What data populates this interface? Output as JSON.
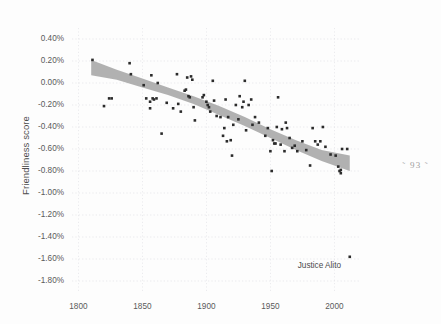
{
  "page": {
    "page_number_label": "˜ 93 ˜",
    "background_color": "#fdfdfd"
  },
  "figure": {
    "y_axis_title": "Friendliness score",
    "x_axis_title": "",
    "annotation_label": "Justice Alito"
  },
  "chart_data": {
    "type": "scatter",
    "title": "",
    "xlabel": "",
    "ylabel": "Friendliness score",
    "xlim": [
      1795,
      2020
    ],
    "ylim": [
      -1.9,
      0.5
    ],
    "grid": true,
    "legend": false,
    "y_tick_labels": [
      "0.40%",
      "0.20%",
      "0.00%",
      "-0.20%",
      "-0.40%",
      "-0.60%",
      "-0.80%",
      "-1.00%",
      "-1.20%",
      "-1.40%",
      "-1.60%",
      "-1.80%"
    ],
    "y_tick_values": [
      0.4,
      0.2,
      0.0,
      -0.2,
      -0.4,
      -0.6,
      -0.8,
      -1.0,
      -1.2,
      -1.4,
      -1.6,
      -1.8
    ],
    "x_tick_labels": [
      "1800",
      "1850",
      "1900",
      "1950",
      "2000"
    ],
    "x_tick_values": [
      1800,
      1850,
      1900,
      1950,
      2000
    ],
    "point_color": "#2b2b2b",
    "band_color": "#a8a8a8",
    "grid_color": "#d8d8e0",
    "annotations": [
      {
        "label": "Justice Alito",
        "x": 2012,
        "y": -1.58
      }
    ],
    "trend_band": {
      "description": "regression fit with confidence interval, declining from about +0.15% in 1810 to about -0.72% in 2012",
      "x": [
        1810,
        1830,
        1850,
        1870,
        1890,
        1910,
        1930,
        1950,
        1970,
        1990,
        2012
      ],
      "upper": [
        0.21,
        0.12,
        0.04,
        -0.04,
        -0.12,
        -0.21,
        -0.31,
        -0.42,
        -0.52,
        -0.61,
        -0.66
      ],
      "lower": [
        0.07,
        0.03,
        -0.04,
        -0.11,
        -0.19,
        -0.29,
        -0.39,
        -0.5,
        -0.61,
        -0.71,
        -0.8
      ]
    },
    "points": [
      {
        "x": 1811,
        "y": 0.21
      },
      {
        "x": 1820,
        "y": -0.21
      },
      {
        "x": 1824,
        "y": -0.14
      },
      {
        "x": 1826,
        "y": -0.14
      },
      {
        "x": 1840,
        "y": 0.18
      },
      {
        "x": 1841,
        "y": 0.08
      },
      {
        "x": 1851,
        "y": -0.02
      },
      {
        "x": 1853,
        "y": -0.14
      },
      {
        "x": 1856,
        "y": -0.17
      },
      {
        "x": 1856,
        "y": -0.23
      },
      {
        "x": 1857,
        "y": 0.07
      },
      {
        "x": 1858,
        "y": -0.14
      },
      {
        "x": 1859,
        "y": -0.15
      },
      {
        "x": 1861,
        "y": -0.14
      },
      {
        "x": 1862,
        "y": 0.0
      },
      {
        "x": 1865,
        "y": -0.46
      },
      {
        "x": 1869,
        "y": -0.18
      },
      {
        "x": 1874,
        "y": -0.23
      },
      {
        "x": 1877,
        "y": 0.08
      },
      {
        "x": 1878,
        "y": -0.19
      },
      {
        "x": 1880,
        "y": -0.26
      },
      {
        "x": 1883,
        "y": -0.07
      },
      {
        "x": 1884,
        "y": -0.06
      },
      {
        "x": 1885,
        "y": 0.05
      },
      {
        "x": 1886,
        "y": -0.12
      },
      {
        "x": 1887,
        "y": -0.13
      },
      {
        "x": 1888,
        "y": 0.06
      },
      {
        "x": 1889,
        "y": 0.03
      },
      {
        "x": 1890,
        "y": -0.22
      },
      {
        "x": 1891,
        "y": -0.34
      },
      {
        "x": 1897,
        "y": -0.13
      },
      {
        "x": 1898,
        "y": -0.11
      },
      {
        "x": 1900,
        "y": -0.17
      },
      {
        "x": 1901,
        "y": -0.2
      },
      {
        "x": 1902,
        "y": -0.22
      },
      {
        "x": 1903,
        "y": -0.26
      },
      {
        "x": 1905,
        "y": 0.02
      },
      {
        "x": 1906,
        "y": -0.16
      },
      {
        "x": 1908,
        "y": -0.3
      },
      {
        "x": 1911,
        "y": -0.31
      },
      {
        "x": 1913,
        "y": -0.48
      },
      {
        "x": 1914,
        "y": -0.41
      },
      {
        "x": 1915,
        "y": -0.15
      },
      {
        "x": 1916,
        "y": -0.53
      },
      {
        "x": 1917,
        "y": -0.31
      },
      {
        "x": 1919,
        "y": -0.52
      },
      {
        "x": 1920,
        "y": -0.66
      },
      {
        "x": 1921,
        "y": -0.38
      },
      {
        "x": 1923,
        "y": -0.2
      },
      {
        "x": 1925,
        "y": -0.33
      },
      {
        "x": 1926,
        "y": -0.12
      },
      {
        "x": 1928,
        "y": -0.22
      },
      {
        "x": 1929,
        "y": -0.17
      },
      {
        "x": 1930,
        "y": 0.02
      },
      {
        "x": 1931,
        "y": -0.43
      },
      {
        "x": 1933,
        "y": -0.2
      },
      {
        "x": 1935,
        "y": -0.15
      },
      {
        "x": 1936,
        "y": -0.38
      },
      {
        "x": 1938,
        "y": -0.31
      },
      {
        "x": 1941,
        "y": -0.36
      },
      {
        "x": 1946,
        "y": -0.48
      },
      {
        "x": 1948,
        "y": -0.41
      },
      {
        "x": 1950,
        "y": -0.62
      },
      {
        "x": 1951,
        "y": -0.8
      },
      {
        "x": 1952,
        "y": -0.52
      },
      {
        "x": 1953,
        "y": -0.55
      },
      {
        "x": 1954,
        "y": -0.55
      },
      {
        "x": 1955,
        "y": -0.4
      },
      {
        "x": 1956,
        "y": -0.13
      },
      {
        "x": 1958,
        "y": -0.56
      },
      {
        "x": 1959,
        "y": -0.42
      },
      {
        "x": 1961,
        "y": -0.62
      },
      {
        "x": 1962,
        "y": -0.36
      },
      {
        "x": 1963,
        "y": -0.41
      },
      {
        "x": 1965,
        "y": -0.5
      },
      {
        "x": 1967,
        "y": -0.59
      },
      {
        "x": 1969,
        "y": -0.57
      },
      {
        "x": 1971,
        "y": -0.62
      },
      {
        "x": 1975,
        "y": -0.53
      },
      {
        "x": 1978,
        "y": -0.61
      },
      {
        "x": 1981,
        "y": -0.75
      },
      {
        "x": 1983,
        "y": -0.41
      },
      {
        "x": 1985,
        "y": -0.53
      },
      {
        "x": 1987,
        "y": -0.56
      },
      {
        "x": 1989,
        "y": -0.53
      },
      {
        "x": 1991,
        "y": -0.4
      },
      {
        "x": 1993,
        "y": -0.58
      },
      {
        "x": 1997,
        "y": -0.65
      },
      {
        "x": 2001,
        "y": -0.66
      },
      {
        "x": 2003,
        "y": -0.76
      },
      {
        "x": 2004,
        "y": -0.8
      },
      {
        "x": 2005,
        "y": -0.79
      },
      {
        "x": 2005,
        "y": -0.82
      },
      {
        "x": 2006,
        "y": -0.6
      },
      {
        "x": 2010,
        "y": -0.6
      },
      {
        "x": 2012,
        "y": -1.58
      }
    ]
  }
}
